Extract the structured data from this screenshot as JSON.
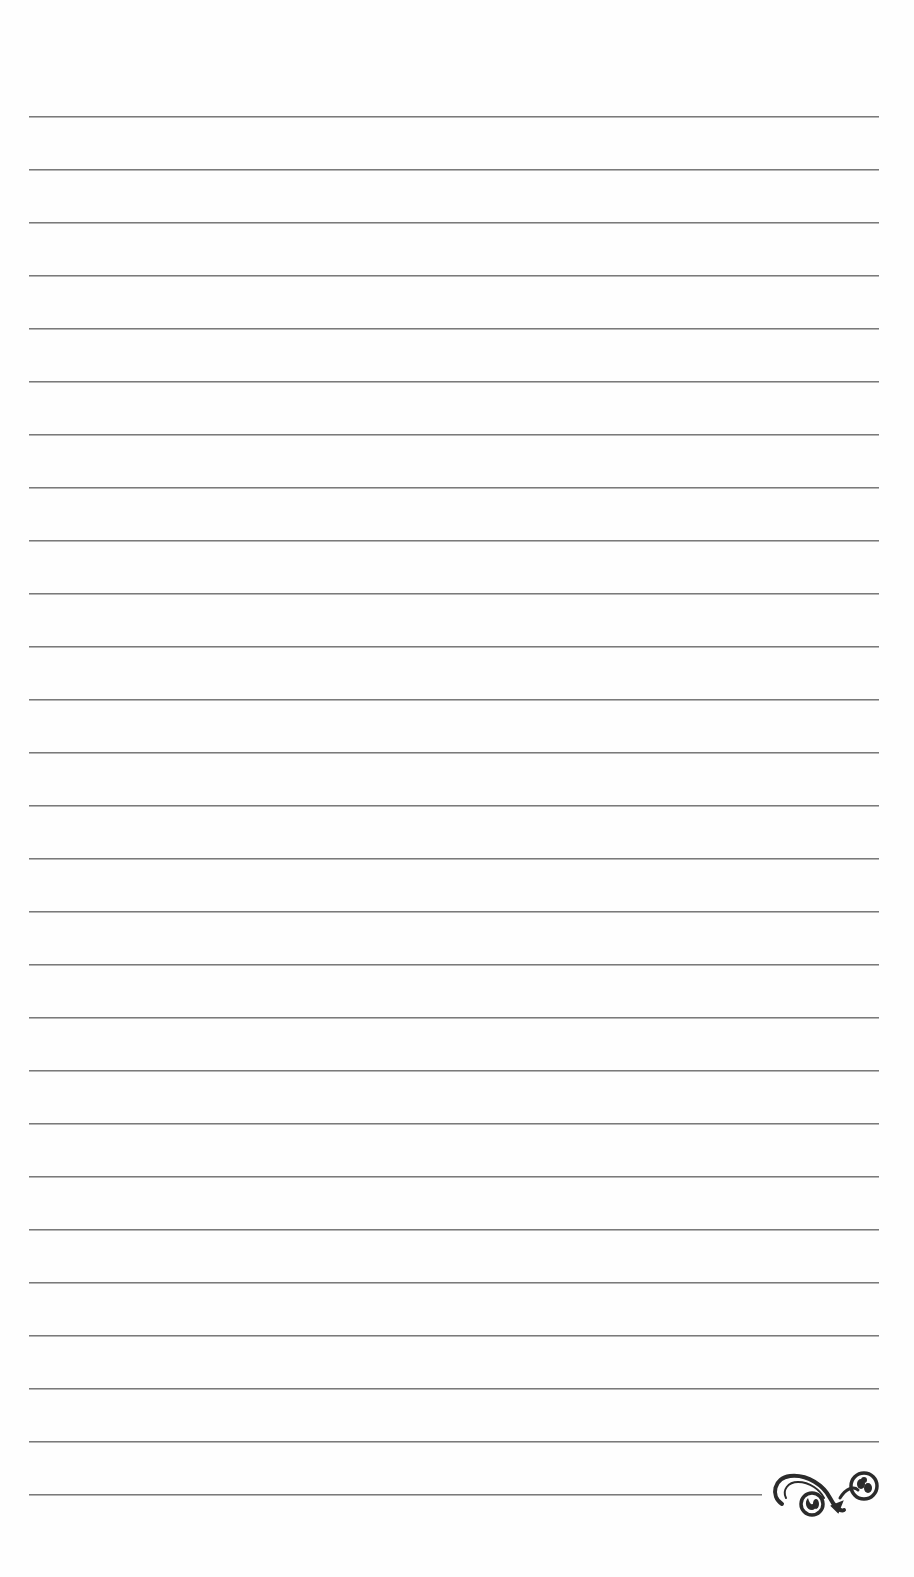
{
  "page": {
    "type": "lined-paper",
    "background_color": "#fefefe",
    "line_color": "#7a7a7a",
    "line_count": 27,
    "first_line_y": 116,
    "line_spacing": 53,
    "line_left": 29,
    "line_right": 879,
    "last_line_right": 762
  },
  "ornament": {
    "icon": "flourish-ornament-icon",
    "color": "#2b2b2b"
  }
}
